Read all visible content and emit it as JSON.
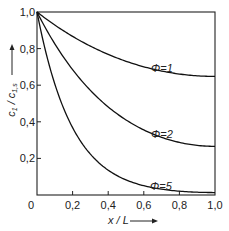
{
  "chart_data": {
    "type": "line",
    "title": "",
    "xlabel": "x / L",
    "ylabel": "c1 / c1,s",
    "xlim": [
      0,
      1.0
    ],
    "ylim": [
      0,
      1.0
    ],
    "x_ticks": [
      "0",
      "0,2",
      "0,4",
      "0,6",
      "0,8",
      "1,0"
    ],
    "y_ticks": [
      "0,2",
      "0,4",
      "0,6",
      "0,8",
      "1,0"
    ],
    "grid": false,
    "x": [
      0,
      0.1,
      0.2,
      0.3,
      0.4,
      0.5,
      0.6,
      0.7,
      0.8,
      0.9,
      1.0
    ],
    "series": [
      {
        "name": "Φ=1",
        "values": [
          1.0,
          0.909,
          0.835,
          0.775,
          0.727,
          0.691,
          0.666,
          0.651,
          0.643,
          0.641,
          0.648
        ]
      },
      {
        "name": "Φ=2",
        "values": [
          1.0,
          0.828,
          0.69,
          0.578,
          0.488,
          0.418,
          0.365,
          0.325,
          0.298,
          0.281,
          0.266
        ]
      },
      {
        "name": "Φ=5",
        "values": [
          1.0,
          0.607,
          0.368,
          0.223,
          0.135,
          0.082,
          0.05,
          0.031,
          0.02,
          0.015,
          0.013
        ]
      }
    ],
    "annotations": [
      "Φ=1",
      "Φ=2",
      "Φ=5"
    ]
  },
  "labels": {
    "xlabel": "x / L",
    "ylabel_main": "c",
    "phi1": "Φ=1",
    "phi2": "Φ=2",
    "phi5": "Φ=5"
  }
}
